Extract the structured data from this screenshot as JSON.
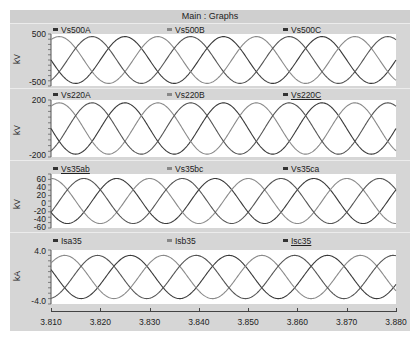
{
  "window": {
    "title": "Main : Graphs"
  },
  "colors": {
    "phase_a": "#3a3a3a",
    "phase_b": "#8a8a8a",
    "phase_c": "#555555",
    "frame_bg": "#d4d4d4",
    "plot_bg": "#ffffff"
  },
  "chart_data": [
    {
      "type": "line",
      "title": "",
      "ylabel": "kV",
      "ylim": [
        -500,
        500
      ],
      "y_ticks": [
        "500",
        "-500"
      ],
      "x": [
        3.81,
        3.88
      ],
      "frequency_hz": 50,
      "series": [
        {
          "name": "Vs500A",
          "amplitude": 450,
          "phase_deg": 0
        },
        {
          "name": "Vs500B",
          "amplitude": 450,
          "phase_deg": -120
        },
        {
          "name": "Vs500C",
          "amplitude": 450,
          "phase_deg": 120
        }
      ]
    },
    {
      "type": "line",
      "title": "",
      "ylabel": "kV",
      "ylim": [
        -200,
        200
      ],
      "y_ticks": [
        "200",
        "-200"
      ],
      "x": [
        3.81,
        3.88
      ],
      "frequency_hz": 50,
      "series": [
        {
          "name": "Vs220A",
          "amplitude": 180,
          "phase_deg": 0
        },
        {
          "name": "Vs220B",
          "amplitude": 180,
          "phase_deg": -120
        },
        {
          "name": "Vs220C",
          "amplitude": 180,
          "phase_deg": 120
        }
      ]
    },
    {
      "type": "line",
      "title": "",
      "ylabel": "kV",
      "ylim": [
        -60,
        60
      ],
      "y_ticks": [
        "60",
        "40",
        "20",
        "0",
        "-20",
        "-40",
        "-60"
      ],
      "x": [
        3.81,
        3.88
      ],
      "frequency_hz": 50,
      "series": [
        {
          "name": "Vs35ab",
          "amplitude": 50,
          "phase_deg": 30
        },
        {
          "name": "Vs35bc",
          "amplitude": 50,
          "phase_deg": -90
        },
        {
          "name": "Vs35ca",
          "amplitude": 50,
          "phase_deg": 150
        }
      ]
    },
    {
      "type": "line",
      "title": "",
      "ylabel": "kA",
      "ylim": [
        -4.0,
        4.0
      ],
      "y_ticks": [
        "4.0",
        "-4.0"
      ],
      "x": [
        3.81,
        3.88
      ],
      "frequency_hz": 50,
      "series": [
        {
          "name": "Isa35",
          "amplitude": 3.2,
          "phase_deg": -20
        },
        {
          "name": "Isb35",
          "amplitude": 3.2,
          "phase_deg": -140
        },
        {
          "name": "Isc35",
          "amplitude": 3.2,
          "phase_deg": 100
        }
      ]
    }
  ],
  "x_axis": {
    "ticks": [
      "3.810",
      "3.820",
      "3.830",
      "3.840",
      "3.850",
      "3.860",
      "3.870",
      "3.880"
    ],
    "range": [
      3.81,
      3.88
    ]
  },
  "panels": [
    {
      "ylabel": "kV",
      "ytop": "500",
      "ybottom": "-500",
      "legend": [
        "Vs500A",
        "Vs500B",
        "Vs500C"
      ],
      "underlined": [
        false,
        false,
        true
      ]
    },
    {
      "ylabel": "kV",
      "ytop": "200",
      "ybottom": "-200",
      "legend": [
        "Vs220A",
        "Vs220B",
        "Vs220C"
      ],
      "underlined": [
        false,
        false,
        true
      ]
    },
    {
      "ylabel": "kV",
      "ticks": [
        "60",
        "40",
        "20",
        "0",
        "-20",
        "-40",
        "-60"
      ],
      "legend": [
        "Vs35ab",
        "Vs35bc",
        "Vs35ca"
      ],
      "underlined": [
        true,
        false,
        false
      ]
    },
    {
      "ylabel": "kA",
      "ytop": "4.0",
      "ybottom": "-4.0",
      "legend": [
        "Isa35",
        "Isb35",
        "Isc35"
      ],
      "underlined": [
        false,
        false,
        true
      ]
    }
  ]
}
